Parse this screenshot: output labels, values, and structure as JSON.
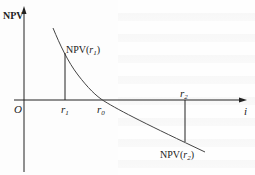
{
  "diagram": {
    "y_axis_label": "NPV",
    "x_axis_label": "i",
    "origin_label": "O",
    "points": {
      "r1": {
        "label": "r",
        "sub": "1"
      },
      "r0": {
        "label": "r",
        "sub": "0"
      },
      "r2": {
        "label": "r",
        "sub": "2"
      }
    },
    "annotations": {
      "npv_r1": {
        "prefix": "NPV(",
        "var": "r",
        "sub": "1",
        "suffix": ")"
      },
      "npv_r2": {
        "prefix": "NPV(",
        "var": "r",
        "sub": "2",
        "suffix": ")"
      }
    },
    "colors": {
      "line": "#333333",
      "axis": "#222222"
    }
  }
}
